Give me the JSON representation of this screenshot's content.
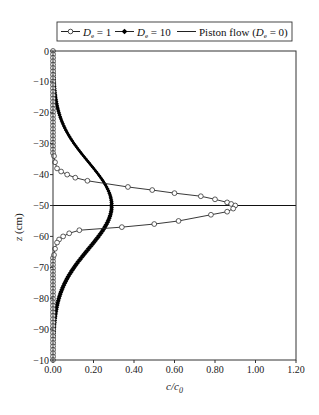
{
  "chart_data": {
    "type": "line",
    "title": "",
    "xlabel": "c/c0",
    "ylabel": "z (cm)",
    "xlim": [
      0,
      1.2
    ],
    "ylim": [
      -100,
      0
    ],
    "grid": false,
    "legend_position": "top",
    "x_ticks": [
      "0.00",
      "0.20",
      "0.40",
      "0.60",
      "0.80",
      "1.00",
      "1.20"
    ],
    "y_ticks": [
      "0",
      "-10",
      "-20",
      "-30",
      "-40",
      "-50",
      "-60",
      "-70",
      "-80",
      "-90",
      "-10"
    ],
    "legend": [
      {
        "label": "De = 1",
        "marker": "open-circle"
      },
      {
        "label": "De = 10",
        "marker": "filled-diamond"
      },
      {
        "label": "Piston flow (De = 0)",
        "marker": "none"
      }
    ],
    "series": [
      {
        "name": "De = 1",
        "marker": "open-circle",
        "points": [
          [
            0.0,
            0
          ],
          [
            0.0,
            -5
          ],
          [
            0.0,
            -10
          ],
          [
            0.0,
            -15
          ],
          [
            0.0,
            -20
          ],
          [
            0.0,
            -25
          ],
          [
            0.0,
            -30
          ],
          [
            0.005,
            -34
          ],
          [
            0.01,
            -36
          ],
          [
            0.02,
            -38
          ],
          [
            0.04,
            -39
          ],
          [
            0.07,
            -40
          ],
          [
            0.11,
            -41
          ],
          [
            0.17,
            -42
          ],
          [
            0.37,
            -44
          ],
          [
            0.49,
            -45
          ],
          [
            0.6,
            -46
          ],
          [
            0.73,
            -47
          ],
          [
            0.8,
            -48
          ],
          [
            0.86,
            -49
          ],
          [
            0.88,
            -49.5
          ],
          [
            0.9,
            -50
          ],
          [
            0.89,
            -51
          ],
          [
            0.86,
            -52
          ],
          [
            0.78,
            -53
          ],
          [
            0.62,
            -55
          ],
          [
            0.5,
            -56
          ],
          [
            0.34,
            -57
          ],
          [
            0.13,
            -58
          ],
          [
            0.08,
            -59
          ],
          [
            0.05,
            -60
          ],
          [
            0.03,
            -61
          ],
          [
            0.02,
            -62
          ],
          [
            0.01,
            -64
          ],
          [
            0.005,
            -66
          ],
          [
            0.0,
            -70
          ],
          [
            0.0,
            -75
          ],
          [
            0.0,
            -80
          ],
          [
            0.0,
            -85
          ],
          [
            0.0,
            -90
          ],
          [
            0.0,
            -95
          ],
          [
            0.0,
            -100
          ]
        ]
      },
      {
        "name": "De = 10",
        "marker": "filled-diamond",
        "peak": {
          "c": 0.29,
          "z": -50
        },
        "sigma_cm": 14
      },
      {
        "name": "Piston flow (De = 0)",
        "marker": "none",
        "points": [
          [
            0,
            -50
          ],
          [
            1.2,
            -50
          ]
        ]
      }
    ]
  }
}
